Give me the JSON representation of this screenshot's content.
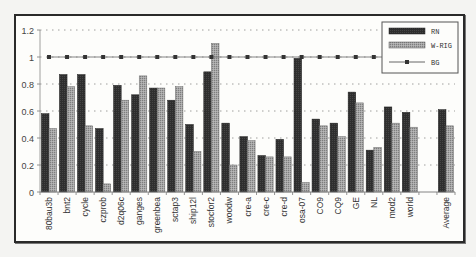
{
  "chart_data": {
    "type": "bar",
    "title": "",
    "xlabel": "",
    "ylabel": "",
    "ylim": [
      0,
      1.2
    ],
    "yticks": [
      "0",
      "0.2",
      "0.4",
      "0.6",
      "0.8",
      "1",
      "1.2"
    ],
    "grid": "horizontal dotted",
    "legend_position": "top-right inside",
    "categories": [
      "80bau3b",
      "bnt2",
      "cycle",
      "czprob",
      "d2q06c",
      "ganges",
      "greenbea",
      "sctap3",
      "ship12l",
      "stocfor2",
      "woodw",
      "cre-a",
      "cre-c",
      "cre-d",
      "osa-07",
      "CO9",
      "CQ9",
      "GE",
      "NL",
      "mod2",
      "world",
      "",
      "Average"
    ],
    "series": [
      {
        "name": "RN",
        "type": "bar",
        "color": "#333333",
        "values": [
          0.58,
          0.87,
          0.87,
          0.47,
          0.79,
          0.72,
          0.77,
          0.68,
          0.5,
          0.89,
          0.51,
          0.41,
          0.27,
          0.39,
          0.99,
          0.54,
          0.51,
          0.74,
          0.31,
          0.63,
          0.59,
          null,
          0.61
        ]
      },
      {
        "name": "W-RIG",
        "type": "bar",
        "color": "#9a9a9a",
        "values": [
          0.47,
          0.78,
          0.49,
          0.06,
          0.68,
          0.86,
          0.77,
          0.78,
          0.3,
          1.1,
          0.2,
          0.38,
          0.26,
          0.26,
          0.07,
          0.49,
          0.41,
          0.66,
          0.33,
          0.51,
          0.48,
          null,
          0.49
        ]
      },
      {
        "name": "BG",
        "type": "line",
        "color": "#555555",
        "marker": "square",
        "values": [
          1,
          1,
          1,
          1,
          1,
          1,
          1,
          1,
          1,
          1,
          1,
          1,
          1,
          1,
          1,
          1,
          1,
          1,
          1,
          1,
          1,
          null,
          null
        ]
      }
    ]
  },
  "legend": {
    "items": [
      {
        "label": "RN"
      },
      {
        "label": "W-RIG"
      },
      {
        "label": "BG"
      }
    ]
  }
}
